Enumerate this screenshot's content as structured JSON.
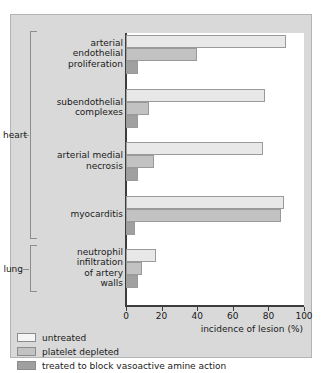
{
  "chart_data": {
    "type": "bar",
    "orientation": "horizontal",
    "title": "",
    "xlabel": "incidence of lesion (%)",
    "ylabel": "",
    "xlim": [
      0,
      100
    ],
    "xticks": [
      0,
      20,
      40,
      60,
      80,
      100
    ],
    "grid": false,
    "legend_position": "below-left",
    "series": [
      {
        "name": "untreated",
        "color": "#e8e8e8",
        "values": [
          90,
          78,
          77,
          89,
          17
        ]
      },
      {
        "name": "platelet depleted",
        "color": "#c2c2c2",
        "values": [
          40,
          13,
          16,
          87,
          9
        ]
      },
      {
        "name": "treated to block vasoactive amine action",
        "color": "#a0a0a0",
        "values": [
          7,
          7,
          7,
          5,
          7
        ]
      }
    ],
    "categories": [
      "arterial endothelial proliferation",
      "subendothelial complexes",
      "arterial medial necrosis",
      "myocarditis",
      "neutrophil infiltration of artery walls"
    ],
    "category_lines": [
      [
        "arterial",
        "endothelial",
        "proliferation"
      ],
      [
        "subendothelial",
        "complexes"
      ],
      [
        "arterial medial",
        "necrosis"
      ],
      [
        "myocarditis"
      ],
      [
        "neutrophil",
        "infiltration",
        "of artery",
        "walls"
      ]
    ],
    "groups": [
      {
        "label": "heart",
        "categories": [
          0,
          1,
          2,
          3
        ]
      },
      {
        "label": "lung",
        "categories": [
          4
        ]
      }
    ]
  },
  "legend": {
    "items": [
      {
        "label": "untreated"
      },
      {
        "label": "platelet depleted"
      },
      {
        "label": "treated to block vasoactive amine action"
      }
    ]
  }
}
